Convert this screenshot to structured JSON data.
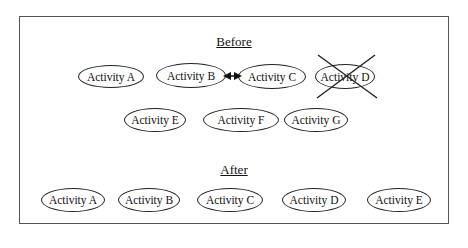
{
  "diagram": {
    "before": {
      "title": "Before",
      "activities": [
        {
          "label": "Activity A",
          "removed": false
        },
        {
          "label": "Activity B",
          "removed": false
        },
        {
          "label": "Activity C",
          "removed": false
        },
        {
          "label": "Activity D",
          "removed": true
        },
        {
          "label": "Activity E",
          "removed": false
        },
        {
          "label": "Activity F",
          "removed": false
        },
        {
          "label": "Activity G",
          "removed": false
        }
      ],
      "connections": [
        {
          "from": "Activity B",
          "to": "Activity C",
          "type": "bidirectional-arrow"
        }
      ]
    },
    "after": {
      "title": "After",
      "activities": [
        {
          "label": "Activity A"
        },
        {
          "label": "Activity B"
        },
        {
          "label": "Activity C"
        },
        {
          "label": "Activity D"
        },
        {
          "label": "Activity E"
        }
      ]
    }
  }
}
